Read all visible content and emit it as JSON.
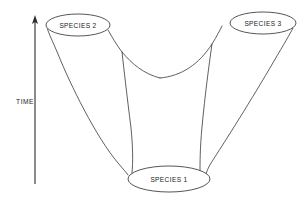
{
  "figure": {
    "type": "speciation-branching-diagram",
    "background_color": "#ffffff",
    "line_color": "#2b2b2b",
    "text_color": "#1a1a1a"
  },
  "axis": {
    "label": "TIME",
    "direction": "upward",
    "arrow_icon": "up-arrow-icon",
    "x": 35,
    "y_top": 18,
    "y_bottom": 184,
    "label_x": 25,
    "label_y": 102
  },
  "nodes": [
    {
      "id": "species-1",
      "label": "SPECIES 1",
      "position": "bottom-center",
      "cx": 169,
      "cy": 179,
      "rx": 41,
      "ry": 13
    },
    {
      "id": "species-2",
      "label": "SPECIES 2",
      "position": "top-left",
      "cx": 78,
      "cy": 25,
      "rx": 32,
      "ry": 11
    },
    {
      "id": "species-3",
      "label": "SPECIES 3",
      "position": "top-right",
      "cx": 263,
      "cy": 23,
      "rx": 33,
      "ry": 11
    }
  ],
  "surfaces": [
    {
      "id": "left-outer-edge",
      "from": "species-2",
      "to": "species-1",
      "path": "M 47.5 29 C 49 34 52 40 58 54 C 70 84 96 137 118 163 C 123 169 126 172 128 175"
    },
    {
      "id": "left-inner-edge",
      "from": "species-2",
      "to": "valley",
      "path": "M 108 30 C 112 37 116 44 122 52 C 132 64 144 74 160 78"
    },
    {
      "id": "valley-right-edge",
      "from": "valley",
      "to": "species-3",
      "path": "M 160 78 C 182 76 199 64 212 44 C 217 36 220 30 222 26"
    },
    {
      "id": "right-outer-edge",
      "from": "species-3",
      "to": "species-1",
      "path": "M 293 28 C 290 34 284 44 274 61 C 252 99 224 143 211 163 C 208 168 207 171 206 174"
    },
    {
      "id": "funnel-left-wall",
      "from": "valley",
      "to": "species-1",
      "path": "M 122 52 C 124 70 127 96 131 128 C 133 148 133 162 132 173"
    },
    {
      "id": "funnel-right-wall",
      "from": "valley",
      "to": "species-1",
      "path": "M 212 44 C 209 65 205 95 202 127 C 200 148 200 163 200 173"
    }
  ],
  "meta": {
    "node_count": 3,
    "branch_count": 2
  }
}
